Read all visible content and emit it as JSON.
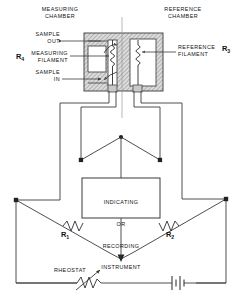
{
  "diagram": {
    "labels": {
      "measuring_chamber": "MEASURING\nCHAMBER",
      "reference_chamber": "REFERENCE\nCHAMBER",
      "sample_out": "SAMPLE\nOUT",
      "sample_in": "SAMPLE\nIN",
      "measuring_filament": "MEASURING\nFILAMENT",
      "reference_filament": "REFERENCE\nFILAMENT",
      "rheostat": "RHEOSTAT"
    },
    "resistors": {
      "r1": "R",
      "r1_sub": "1",
      "r2": "R",
      "r2_sub": "2",
      "r3": "R",
      "r3_sub": "3",
      "r4": "R",
      "r4_sub": "4"
    },
    "instrument": {
      "line1": "INDICATING",
      "line2": "OR",
      "line3": "RECORDING",
      "line4": "INSTRUMENT"
    },
    "components": {
      "battery": "battery-symbol",
      "rheostat_symbol": "variable-resistor-symbol",
      "measuring_filament_coil": "filament-coil",
      "reference_filament_coil": "filament-coil",
      "flow_arrow_in": "gas-flow-arrow",
      "flow_arrow_out": "gas-flow-arrow"
    },
    "colors": {
      "line": "#3a3a3a",
      "hatch": "#8d8d8d",
      "block_fill": "#d8d8d8",
      "chamber_fill": "#ffffff",
      "node": "#222222",
      "background": "#ffffff"
    }
  }
}
